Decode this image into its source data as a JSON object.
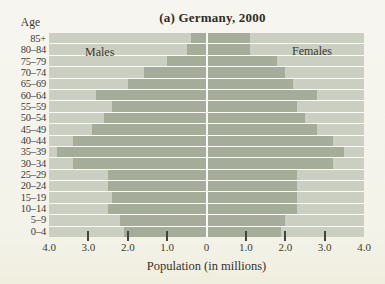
{
  "figure": {
    "title": "(a) Germany, 2000",
    "age_axis_label": "Age",
    "x_axis_label": "Population (in millions)",
    "male_label": "Males",
    "female_label": "Females"
  },
  "colors": {
    "page_bg": "#f5f4ed",
    "plot_bg": "#cbcfc1",
    "bar": "#a5ac9a",
    "gridline": "#fafaf4",
    "text": "#393830"
  },
  "chart_data": {
    "type": "bar",
    "subtype": "population-pyramid",
    "title": "(a) Germany, 2000",
    "xlabel": "Population (in millions)",
    "ylabel": "Age",
    "grid": "horizontal-white-row-separators",
    "legend_position": "in-plot (Males left, Females right)",
    "xlim_each_side": 4.0,
    "x_tick_values": [
      -4,
      -3,
      -2,
      -1,
      0,
      1,
      2,
      3,
      4
    ],
    "x_tick_labels": [
      "4.0",
      "3.0",
      "2.0",
      "1.0",
      "0",
      "1.0",
      "2.0",
      "3.0",
      "4.0"
    ],
    "tick_mark_values": [
      -3,
      -2,
      -1,
      1,
      2,
      3
    ],
    "categories": [
      "85+",
      "80–84",
      "75–79",
      "70–74",
      "65–69",
      "60–64",
      "55–59",
      "50–54",
      "45–49",
      "40–44",
      "35–39",
      "30–34",
      "25–29",
      "20–24",
      "15–19",
      "10–14",
      "5–9",
      "0–4"
    ],
    "series": [
      {
        "name": "Males",
        "side": "left",
        "values": [
          0.4,
          0.5,
          1.0,
          1.6,
          2.0,
          2.8,
          2.4,
          2.6,
          2.9,
          3.4,
          3.8,
          3.4,
          2.5,
          2.5,
          2.4,
          2.5,
          2.2,
          2.1
        ]
      },
      {
        "name": "Females",
        "side": "right",
        "values": [
          1.1,
          1.1,
          1.8,
          2.0,
          2.2,
          2.8,
          2.3,
          2.5,
          2.8,
          3.2,
          3.5,
          3.2,
          2.3,
          2.3,
          2.3,
          2.3,
          2.0,
          1.9
        ]
      }
    ]
  }
}
